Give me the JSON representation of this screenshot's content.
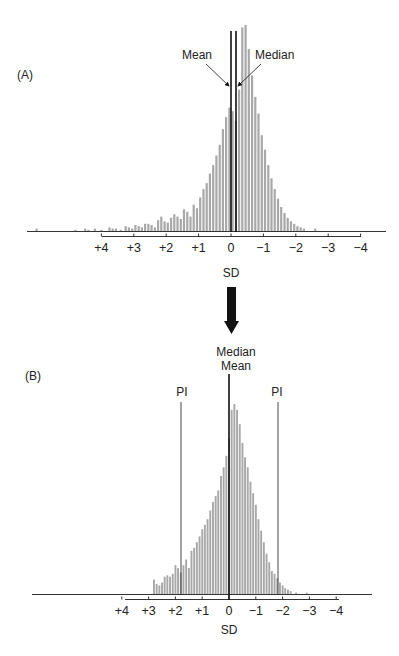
{
  "figure": {
    "panel_a_label": "(A)",
    "panel_b_label": "(B)",
    "bar_color": "#a8a8a8",
    "line_color": "#111111",
    "axis_color": "#333333"
  },
  "chart_data": [
    {
      "panel": "A",
      "type": "bar",
      "title": "",
      "xlabel": "SD",
      "ylabel": "",
      "x_tick_labels": [
        "+4",
        "+3",
        "+2",
        "+1",
        "0",
        "−1",
        "−2",
        "−3",
        "−4"
      ],
      "x_tick_values": [
        4,
        3,
        2,
        1,
        0,
        -1,
        -2,
        -3,
        -4
      ],
      "xlim": [
        6.2,
        -4.8
      ],
      "grid": false,
      "legend": null,
      "annotations": [
        {
          "text": "Mean",
          "x_sd": 0.0,
          "kind": "vertical-line-with-arrow"
        },
        {
          "text": "Median",
          "x_sd": -0.15,
          "kind": "vertical-line-with-arrow"
        }
      ],
      "distribution": "left-skewed histogram, long tail toward positive SD",
      "bins_sd": [
        6.0,
        4.8,
        4.5,
        4.4,
        4.2,
        4.0,
        3.75,
        3.65,
        3.55,
        3.4,
        3.25,
        3.15,
        3.05,
        2.95,
        2.85,
        2.75,
        2.65,
        2.55,
        2.45,
        2.35,
        2.25,
        2.15,
        2.05,
        1.95,
        1.85,
        1.75,
        1.65,
        1.55,
        1.45,
        1.35,
        1.25,
        1.15,
        1.05,
        0.95,
        0.85,
        0.75,
        0.65,
        0.55,
        0.45,
        0.35,
        0.25,
        0.15,
        0.05,
        -0.05,
        -0.15,
        -0.25,
        -0.35,
        -0.45,
        -0.55,
        -0.65,
        -0.75,
        -0.85,
        -0.95,
        -1.05,
        -1.15,
        -1.25,
        -1.35,
        -1.45,
        -1.55,
        -1.65,
        -1.75,
        -1.85,
        -1.95,
        -2.05,
        -2.15,
        -2.25,
        -2.6
      ],
      "values": [
        2,
        1,
        2,
        1,
        2,
        1,
        3,
        2,
        2,
        1,
        4,
        3,
        2,
        5,
        4,
        3,
        6,
        6,
        5,
        3,
        9,
        12,
        8,
        7,
        11,
        14,
        12,
        10,
        18,
        16,
        12,
        22,
        19,
        28,
        35,
        40,
        48,
        55,
        63,
        72,
        85,
        95,
        103,
        100,
        92,
        118,
        170,
        172,
        152,
        130,
        112,
        98,
        80,
        68,
        55,
        44,
        35,
        27,
        20,
        15,
        11,
        8,
        6,
        4,
        3,
        2,
        2
      ]
    },
    {
      "panel": "B",
      "type": "bar",
      "title": "",
      "xlabel": "SD",
      "ylabel": "",
      "x_tick_labels": [
        "+4",
        "+3",
        "+2",
        "+1",
        "0",
        "−1",
        "−2",
        "−3",
        "−4"
      ],
      "x_tick_values": [
        4,
        3,
        2,
        1,
        0,
        -1,
        -2,
        -3,
        -4
      ],
      "xlim": [
        7.5,
        -5.3
      ],
      "grid": false,
      "legend": null,
      "annotations": [
        {
          "text": "Median",
          "x_sd": 0.0,
          "kind": "vertical-line"
        },
        {
          "text": "Mean",
          "x_sd": 0.0,
          "kind": "vertical-line"
        },
        {
          "text": "PI",
          "x_sd": 1.8,
          "kind": "vertical-line"
        },
        {
          "text": "PI",
          "x_sd": -1.8,
          "kind": "vertical-line"
        }
      ],
      "distribution": "near-symmetric histogram centered on 0",
      "bins_sd": [
        2.8,
        2.7,
        2.6,
        2.5,
        2.4,
        2.3,
        2.2,
        2.1,
        2.0,
        1.9,
        1.8,
        1.7,
        1.6,
        1.5,
        1.4,
        1.3,
        1.2,
        1.1,
        1.0,
        0.9,
        0.8,
        0.7,
        0.6,
        0.5,
        0.4,
        0.3,
        0.2,
        0.1,
        0.0,
        -0.1,
        -0.2,
        -0.3,
        -0.4,
        -0.5,
        -0.6,
        -0.7,
        -0.8,
        -0.9,
        -1.0,
        -1.1,
        -1.2,
        -1.3,
        -1.4,
        -1.5,
        -1.6,
        -1.7,
        -1.8,
        -1.9,
        -2.0,
        -2.1,
        -2.2,
        -2.3,
        -2.5,
        -2.9
      ],
      "values": [
        10,
        7,
        6,
        8,
        12,
        13,
        12,
        14,
        20,
        18,
        15,
        20,
        24,
        18,
        30,
        32,
        36,
        40,
        45,
        48,
        52,
        58,
        64,
        68,
        72,
        82,
        88,
        96,
        108,
        128,
        132,
        128,
        118,
        105,
        95,
        88,
        78,
        70,
        62,
        52,
        44,
        36,
        28,
        22,
        16,
        14,
        11,
        8,
        6,
        4,
        3,
        2,
        1,
        1
      ]
    }
  ],
  "panel_a": {
    "mean_label": "Mean",
    "median_label": "Median",
    "axis_title": "SD",
    "ticks": [
      "+4",
      "+3",
      "+2",
      "+1",
      "0",
      "−1",
      "−2",
      "−3",
      "−4"
    ]
  },
  "panel_b": {
    "median_label": "Median",
    "mean_label": "Mean",
    "pi_left_label": "PI",
    "pi_right_label": "PI",
    "axis_title": "SD",
    "ticks": [
      "+4",
      "+3",
      "+2",
      "+1",
      "0",
      "−1",
      "−2",
      "−3",
      "−4"
    ]
  },
  "transition_arrow": "down-arrow"
}
